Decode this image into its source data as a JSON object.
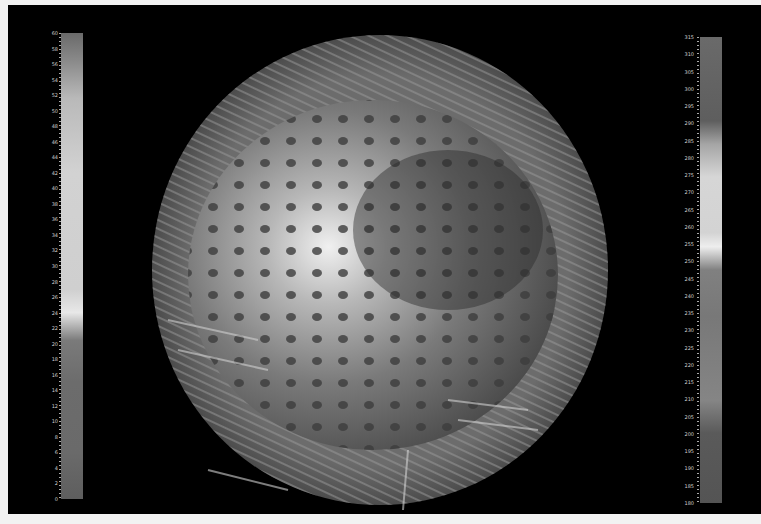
{
  "scene": {
    "description": "3D vector field glyph rendering around a spherical shell (grayscale)",
    "background": "#000000"
  },
  "colorbar_left": {
    "min": 0,
    "max": 60,
    "ticks": [
      "60",
      "58",
      "56",
      "54",
      "52",
      "50",
      "48",
      "46",
      "44",
      "42",
      "40",
      "38",
      "36",
      "34",
      "32",
      "30",
      "28",
      "26",
      "24",
      "22",
      "20",
      "18",
      "16",
      "14",
      "12",
      "10",
      "8",
      "6",
      "4",
      "2",
      "0"
    ]
  },
  "colorbar_right": {
    "min": 180,
    "max": 315,
    "ticks": [
      "315",
      "310",
      "305",
      "300",
      "295",
      "290",
      "285",
      "280",
      "275",
      "270",
      "265",
      "260",
      "255",
      "250",
      "245",
      "240",
      "235",
      "230",
      "225",
      "220",
      "215",
      "210",
      "205",
      "200",
      "195",
      "190",
      "185",
      "180"
    ]
  }
}
